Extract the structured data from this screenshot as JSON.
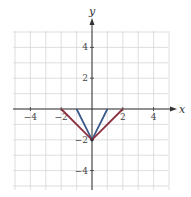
{
  "chart_data": {
    "type": "line",
    "title": "",
    "xlabel": "x",
    "ylabel": "y",
    "xlim": [
      -5,
      5
    ],
    "ylim": [
      -5,
      5
    ],
    "grid": true,
    "x_ticks": [
      -4,
      -2,
      2,
      4
    ],
    "y_ticks": [
      4,
      2,
      -2,
      -4
    ],
    "x_tick_labels": [
      "−4",
      "−2",
      "2",
      "4"
    ],
    "y_tick_labels": [
      "4",
      "2",
      "−2",
      "−4"
    ],
    "series": [
      {
        "name": "blue-v",
        "color": "#3b5a8a",
        "points": [
          [
            -1,
            0
          ],
          [
            0,
            -2
          ],
          [
            1,
            0
          ]
        ]
      },
      {
        "name": "red-v",
        "color": "#8b2f3f",
        "points": [
          [
            -2,
            0
          ],
          [
            0,
            -2
          ],
          [
            2,
            0
          ]
        ]
      }
    ]
  },
  "layout": {
    "origin_px": [
      92,
      109
    ],
    "unit_px": 15.4,
    "grid_color": "#d6d6d6",
    "axis_color": "#333333"
  }
}
